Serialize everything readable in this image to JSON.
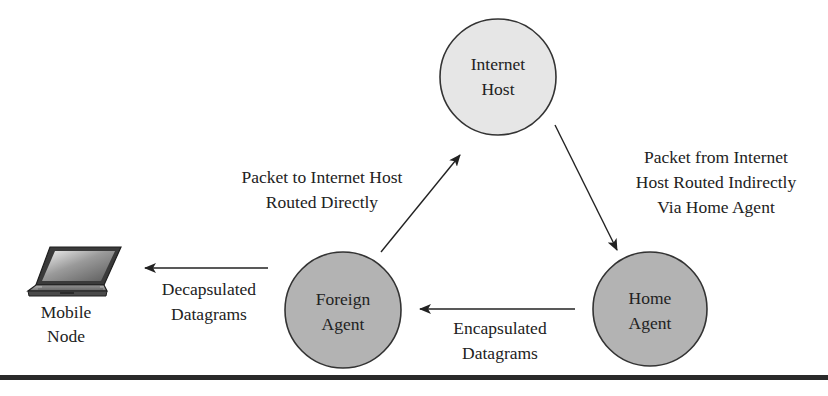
{
  "diagram": {
    "type": "mobile-ip-routing",
    "nodes": {
      "internet_host": {
        "line1": "Internet",
        "line2": "Host",
        "fill": "#e6e6e6"
      },
      "home_agent": {
        "line1": "Home",
        "line2": "Agent",
        "fill": "#b3b3b3"
      },
      "foreign_agent": {
        "line1": "Foreign",
        "line2": "Agent",
        "fill": "#b3b3b3"
      },
      "mobile_node": {
        "line1": "Mobile",
        "line2": "Node",
        "icon": "laptop-icon"
      }
    },
    "edges": {
      "host_to_home": {
        "from": "Internet Host",
        "to": "Home Agent",
        "line1": "Packet from Internet",
        "line2": "Host Routed Indirectly",
        "line3": "Via Home Agent"
      },
      "home_to_foreign": {
        "from": "Home Agent",
        "to": "Foreign Agent",
        "line1": "Encapsulated",
        "line2": "Datagrams"
      },
      "foreign_to_mobile": {
        "from": "Foreign Agent",
        "to": "Mobile Node",
        "line1": "Decapsulated",
        "line2": "Datagrams"
      },
      "foreign_to_host": {
        "from": "Foreign Agent",
        "to": "Internet Host",
        "line1": "Packet to Internet Host",
        "line2": "Routed Directly"
      }
    },
    "colors": {
      "stroke": "#222222",
      "rule": "#2a2a2a"
    }
  }
}
